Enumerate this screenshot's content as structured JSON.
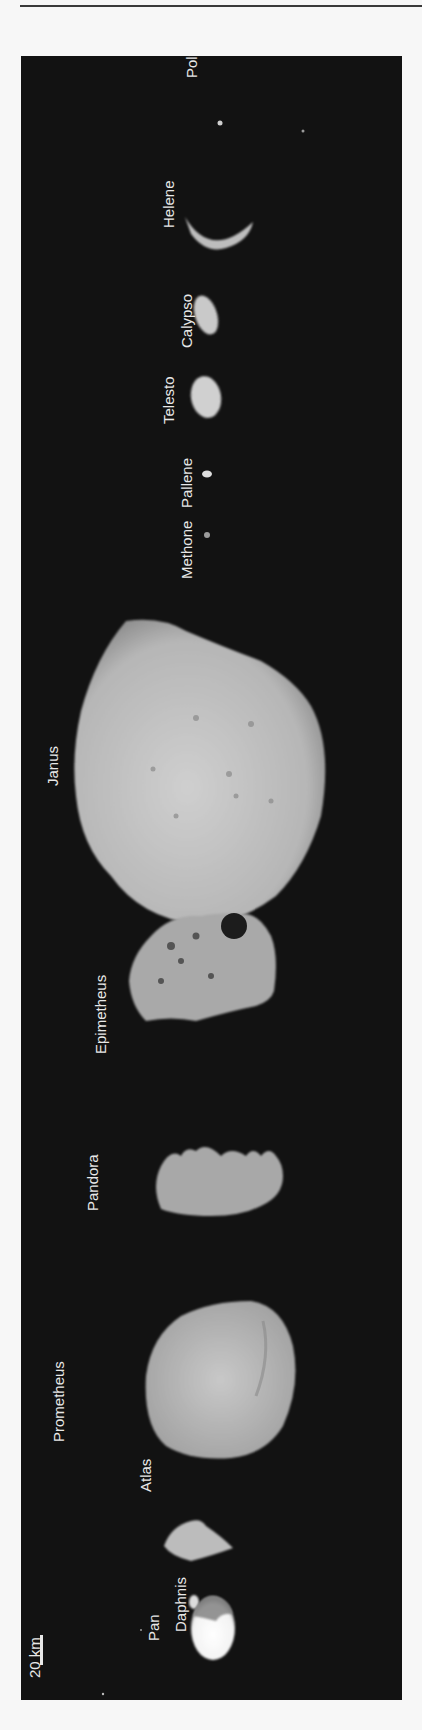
{
  "figure": {
    "background": "#121212",
    "label_color": "#e8e8e8",
    "scale_bar": {
      "label": "20 km"
    },
    "moons": [
      {
        "name": "Pan"
      },
      {
        "name": "Daphnis"
      },
      {
        "name": "Atlas"
      },
      {
        "name": "Prometheus"
      },
      {
        "name": "Pandora"
      },
      {
        "name": "Epimetheus"
      },
      {
        "name": "Janus"
      },
      {
        "name": "Methone"
      },
      {
        "name": "Pallene"
      },
      {
        "name": "Telesto"
      },
      {
        "name": "Calypso"
      },
      {
        "name": "Helene"
      },
      {
        "name": "Polydeuces"
      }
    ]
  }
}
